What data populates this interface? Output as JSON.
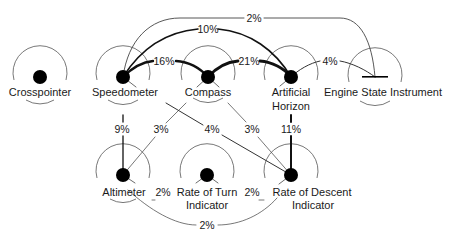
{
  "diagram": {
    "colors": {
      "ink": "#111111",
      "thin": "#555555",
      "background": "#ffffff"
    },
    "instruments": [
      {
        "id": "crosspointer",
        "label": [
          "Crosspointer"
        ],
        "x": 40,
        "y": 77,
        "marker": "dot"
      },
      {
        "id": "speedometer",
        "label": [
          "Speedometer"
        ],
        "x": 123,
        "y": 77,
        "marker": "dot"
      },
      {
        "id": "compass",
        "label": [
          "Compass"
        ],
        "x": 208,
        "y": 77,
        "marker": "dot"
      },
      {
        "id": "artificial-horizon",
        "label": [
          "Artificial",
          "Horizon"
        ],
        "x": 291,
        "y": 77,
        "marker": "dot"
      },
      {
        "id": "engine-state",
        "label": [
          "Engine State Instrument"
        ],
        "x": 375,
        "y": 77,
        "marker": "bar"
      },
      {
        "id": "altimeter",
        "label": [
          "Altimeter"
        ],
        "x": 123,
        "y": 175,
        "marker": "dot"
      },
      {
        "id": "rate-of-turn",
        "label": [
          "Rate of Turn",
          "Indicator"
        ],
        "x": 207,
        "y": 175,
        "marker": "dot"
      },
      {
        "id": "rate-of-descent",
        "label": [
          "Rate of Descent",
          "Indicator"
        ],
        "x": 291,
        "y": 175,
        "marker": "dot"
      }
    ],
    "links": [
      {
        "from": "speedometer",
        "to": "engine-state",
        "value": "2%"
      },
      {
        "from": "speedometer",
        "to": "artificial-horizon",
        "value": "10%"
      },
      {
        "from": "speedometer",
        "to": "compass",
        "value": "16%"
      },
      {
        "from": "compass",
        "to": "artificial-horizon",
        "value": "21%"
      },
      {
        "from": "artificial-horizon",
        "to": "engine-state",
        "value": "4%"
      },
      {
        "from": "speedometer",
        "to": "altimeter",
        "value": "9%"
      },
      {
        "from": "compass",
        "to": "altimeter",
        "value": "3%"
      },
      {
        "from": "speedometer",
        "to": "rate-of-descent",
        "value": "4%"
      },
      {
        "from": "compass",
        "to": "rate-of-descent",
        "value": "3%"
      },
      {
        "from": "artificial-horizon",
        "to": "rate-of-descent",
        "value": "11%"
      },
      {
        "from": "altimeter",
        "to": "rate-of-turn",
        "value": "2%"
      },
      {
        "from": "rate-of-turn",
        "to": "rate-of-descent",
        "value": "2%"
      },
      {
        "from": "altimeter",
        "to": "rate-of-descent",
        "value": "2%"
      }
    ]
  }
}
